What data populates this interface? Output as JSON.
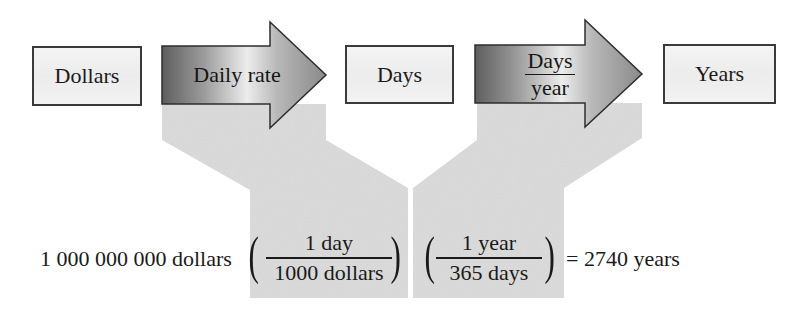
{
  "diagram": {
    "colors": {
      "box_border": "#3a3a3a",
      "box_fill": "#efefef",
      "arrow_dark": "#6a6a6a",
      "arrow_light": "#e8e8e8",
      "arrow_tip": "#8a8a8a",
      "shade": "#d9d9d9",
      "text": "#1a1a1a"
    },
    "nodes": [
      {
        "id": "dollars",
        "label": "Dollars"
      },
      {
        "id": "days",
        "label": "Days"
      },
      {
        "id": "years",
        "label": "Years"
      }
    ],
    "arrows": [
      {
        "id": "daily-rate",
        "label": "Daily rate"
      },
      {
        "id": "days-per-year",
        "numerator": "Days",
        "denominator": "year"
      }
    ],
    "equation": {
      "start_value": "1 000 000 000 dollars",
      "factor1": {
        "numerator": "1 day",
        "denominator": "1000 dollars"
      },
      "factor2": {
        "numerator": "1 year",
        "denominator": "365 days"
      },
      "result": "= 2740 years"
    }
  }
}
